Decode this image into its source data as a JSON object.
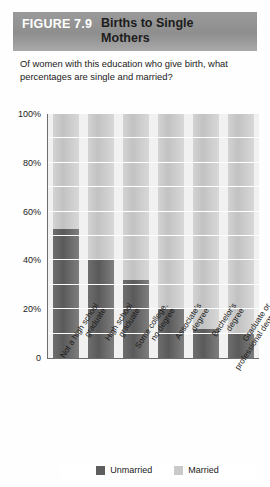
{
  "header": {
    "figure_number": "FIGURE 7.9",
    "title": "Births to Single Mothers"
  },
  "subtitle": "Of women with this education who give birth, what percentages are single and married?",
  "legend": {
    "unmarried_label": "Unmarried",
    "married_label": "Married",
    "unmarried_color": "#5e5e5e",
    "married_color": "#c9c9c9"
  },
  "axis": {
    "y_ticks": [
      "100%",
      "80%",
      "60%",
      "40%",
      "20%",
      "0"
    ]
  },
  "chart_data": {
    "type": "bar",
    "title": "Births to Single Mothers",
    "subtitle": "Of women with this education who give birth, what percentages are single and married?",
    "xlabel": "",
    "ylabel": "",
    "ylim": [
      0,
      100
    ],
    "y_ticks": [
      0,
      20,
      40,
      60,
      80,
      100
    ],
    "y_tick_labels": [
      "0",
      "20%",
      "40%",
      "60%",
      "80%",
      "100%"
    ],
    "gridlines_every": 10,
    "grid": true,
    "legend_position": "bottom",
    "overlap_style": "overlaid",
    "categories": [
      "Not a high school graduate",
      "High school graduate",
      "Some college, no degree",
      "Associate's degree",
      "Bachelor's degree",
      "Graduate or professional degree"
    ],
    "category_lines": [
      [
        "Not a high school",
        "graduate"
      ],
      [
        "High school",
        "graduate"
      ],
      [
        "Some college,",
        "no degree"
      ],
      [
        "Associate's",
        "degree"
      ],
      [
        "Bachelor's",
        "degree"
      ],
      [
        "Graduate or",
        "professional degree"
      ]
    ],
    "series": [
      {
        "name": "Married",
        "color": "#c9c9c9",
        "values": [
          100,
          100,
          100,
          100,
          100,
          100
        ]
      },
      {
        "name": "Unmarried",
        "color": "#5e5e5e",
        "values": [
          53,
          40,
          32,
          20,
          12,
          10
        ]
      }
    ]
  }
}
